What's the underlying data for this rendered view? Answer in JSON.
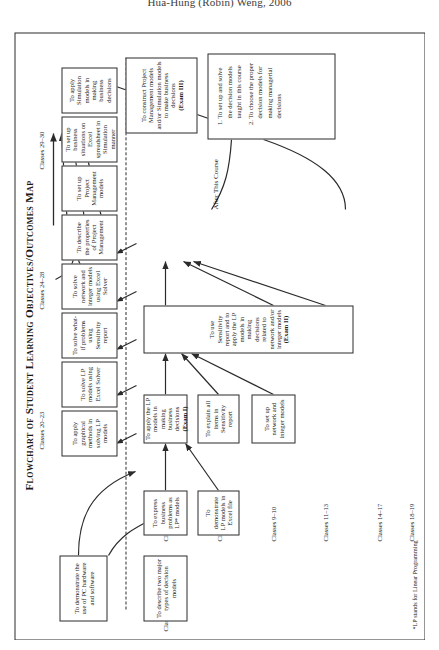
{
  "header": {
    "credit": "Hua-Hung (Robin) Weng, 2006"
  },
  "chart_title": "Flowchart of Student Learning Objectives/Outcomes Map",
  "footnote": "*LP stands for Linear Programming",
  "after_course_label": "After This Course",
  "row_labels": [
    {
      "id": "class-1",
      "text": "Class 1"
    },
    {
      "id": "classes-2-4",
      "text": "Classes 2–4"
    },
    {
      "id": "classes-5-8",
      "text": "Classes 5–8"
    },
    {
      "id": "classes-9-10",
      "text": "Classes 9–10"
    },
    {
      "id": "classes-11-13",
      "text": "Classes 11–13"
    },
    {
      "id": "classes-14-17",
      "text": "Classes 14–17"
    },
    {
      "id": "classes-18-19",
      "text": "Classes 18–19"
    },
    {
      "id": "classes-20-23",
      "text": "Classes 20–23"
    },
    {
      "id": "classes-24-28",
      "text": "Classes 24–28"
    },
    {
      "id": "classes-29-30",
      "text": "Classes 29–30"
    }
  ],
  "boxes": {
    "b_describe_two": "To describe two major types of decision models",
    "b_demo_pc": "To demonstrate the use of PC hardware and software",
    "b_express_lp": "To express business problems as LP* models",
    "b_demo_excel": "To demonstrate LP models in Excel file",
    "b_apply_lp": "To apply the LP models in making business decisions (Exam I)",
    "b_apply_lp_plain": "To apply the LP models in making business decisions ",
    "b_apply_lp_bold": "(Exam I)",
    "b_explain_sens": "To explain all items in Sensitivity report",
    "b_setup_network": "To set up network and integer models",
    "b_use_sens_plain": "To use Sensitivity report and to apply the LP models in making decisions related to network and/or integer models ",
    "b_use_sens_bold": "(Exam II)",
    "b_graphical": "To apply graphical methods in solving LP models",
    "b_solve_excel": "To solve LP models using Excel Solver",
    "b_what_if": "To solve what-if problems using Sensitivity report",
    "b_solve_net": "To solve network and integer models using Excel Solver",
    "b_describe_pm": "To describe the properties of Project Management",
    "b_setup_pm": "To set up Project Management models",
    "b_setup_sim": "To set up business situations on Excel spreadsheet in Simulation manner",
    "b_apply_sim": "To apply Simulation models in making business decisions",
    "b_construct_plain": "To construct Project Management models and/or Simulation models to make business decisions ",
    "b_construct_bold": "(Exam III)"
  },
  "outcomes": [
    "To set up and solve the decision models taught in this course",
    "To choose the proper decision models for making managerial decisions"
  ],
  "colors": {
    "ink": "#2b2b2b",
    "paper": "#ffffff",
    "text": "#1a1a1a"
  }
}
